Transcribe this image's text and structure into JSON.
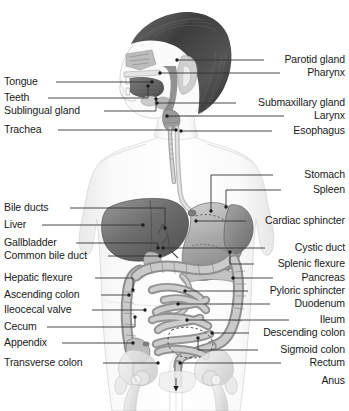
{
  "diagram": {
    "background_color": "#ffffff",
    "text_color": "#1a1a1a",
    "leader_line_color": "#333333",
    "labels_left": [
      {
        "text": "Tongue",
        "y": 82,
        "line_x1": 56,
        "line_y1": 82,
        "elbow_x": 152,
        "tip_x": 152,
        "tip_y": 82
      },
      {
        "text": "Teeth",
        "y": 98,
        "line_x1": 48,
        "line_y1": 98,
        "elbow_x": 148,
        "tip_x": 148,
        "tip_y": 86
      },
      {
        "text": "Sublingual gland",
        "y": 111,
        "line_x1": 104,
        "line_y1": 111,
        "elbow_x": 156,
        "tip_x": 156,
        "tip_y": 99
      },
      {
        "text": "Trachea",
        "y": 130,
        "line_x1": 58,
        "line_y1": 130,
        "elbow_x": 176,
        "tip_x": 176,
        "tip_y": 130
      },
      {
        "text": "Bile ducts",
        "y": 208,
        "line_x1": 70,
        "line_y1": 208,
        "elbow_x": 165,
        "tip_x": 165,
        "tip_y": 228
      },
      {
        "text": "Liver",
        "y": 225,
        "line_x1": 42,
        "line_y1": 225,
        "elbow_x": 143,
        "tip_x": 143,
        "tip_y": 225
      },
      {
        "text": "Gallbladder",
        "y": 243,
        "line_x1": 76,
        "line_y1": 243,
        "elbow_x": 158,
        "tip_x": 158,
        "tip_y": 248
      },
      {
        "text": "Common bile duct",
        "y": 256,
        "line_x1": 108,
        "line_y1": 256,
        "elbow_x": 160,
        "tip_x": 160,
        "tip_y": 256
      },
      {
        "text": "Hepatic flexure",
        "y": 278,
        "line_x1": 95,
        "line_y1": 278,
        "elbow_x": 133,
        "tip_x": 133,
        "tip_y": 290
      },
      {
        "text": "Ascending colon",
        "y": 295,
        "line_x1": 101,
        "line_y1": 295,
        "elbow_x": 129,
        "tip_x": 129,
        "tip_y": 295
      },
      {
        "text": "Ileocecal valve",
        "y": 310,
        "line_x1": 92,
        "line_y1": 310,
        "elbow_x": 145,
        "tip_x": 145,
        "tip_y": 310
      },
      {
        "text": "Cecum",
        "y": 327,
        "line_x1": 47,
        "line_y1": 327,
        "elbow_x": 135,
        "tip_x": 135,
        "tip_y": 317
      },
      {
        "text": "Appendix",
        "y": 343,
        "line_x1": 62,
        "line_y1": 343,
        "elbow_x": 133,
        "tip_x": 133,
        "tip_y": 343
      },
      {
        "text": "Transverse colon",
        "y": 363,
        "line_x1": 103,
        "line_y1": 363,
        "elbow_x": 158,
        "tip_x": 158,
        "tip_y": 363
      }
    ],
    "labels_right": [
      {
        "text": "Parotid gland",
        "y": 60,
        "line_x1": 264,
        "elbow_x": 177,
        "tip_x": 177,
        "tip_y": 60
      },
      {
        "text": "Pharynx",
        "y": 73,
        "line_x1": 280,
        "elbow_x": 160,
        "tip_x": 160,
        "tip_y": 73
      },
      {
        "text": "Submaxillary gland",
        "y": 103,
        "line_x1": 236,
        "elbow_x": 157,
        "tip_x": 157,
        "tip_y": 103
      },
      {
        "text": "Larynx",
        "y": 116,
        "line_x1": 284,
        "elbow_x": 167,
        "tip_x": 167,
        "tip_y": 116
      },
      {
        "text": "Esophagus",
        "y": 131,
        "line_x1": 272,
        "elbow_x": 181,
        "tip_x": 181,
        "tip_y": 131
      },
      {
        "text": "Stomach",
        "y": 175,
        "line_x1": 273,
        "elbow_x": 211,
        "tip_x": 211,
        "tip_y": 211
      },
      {
        "text": "Spleen",
        "y": 190,
        "line_x1": 281,
        "elbow_x": 226,
        "tip_x": 226,
        "tip_y": 207
      },
      {
        "text": "Cardiac sphincter",
        "y": 221,
        "line_x1": 246,
        "elbow_x": 196,
        "tip_x": 196,
        "tip_y": 221
      },
      {
        "text": "Cystic duct",
        "y": 248,
        "line_x1": 265,
        "elbow_x": 163,
        "tip_x": 163,
        "tip_y": 248
      },
      {
        "text": "Splenic flexure",
        "y": 264,
        "line_x1": 254,
        "elbow_x": 230,
        "tip_x": 230,
        "tip_y": 252
      },
      {
        "text": "Pancreas",
        "y": 278,
        "line_x1": 273,
        "elbow_x": 233,
        "tip_x": 233,
        "tip_y": 278
      },
      {
        "text": "Pyloric sphincter",
        "y": 291,
        "line_x1": 248,
        "elbow_x": 185,
        "tip_x": 185,
        "tip_y": 291
      },
      {
        "text": "Duodenum",
        "y": 304,
        "line_x1": 270,
        "elbow_x": 178,
        "tip_x": 178,
        "tip_y": 304
      },
      {
        "text": "Ileum",
        "y": 320,
        "line_x1": 289,
        "elbow_x": 187,
        "tip_x": 187,
        "tip_y": 320
      },
      {
        "text": "Descending colon",
        "y": 333,
        "line_x1": 249,
        "elbow_x": 212,
        "tip_x": 212,
        "tip_y": 333
      },
      {
        "text": "Sigmoid colon",
        "y": 350,
        "line_x1": 258,
        "elbow_x": 198,
        "tip_x": 198,
        "tip_y": 338
      },
      {
        "text": "Rectum",
        "y": 363,
        "line_x1": 281,
        "elbow_x": 180,
        "tip_x": 180,
        "tip_y": 363
      },
      {
        "text": "Anus",
        "y": 381,
        "line_x1": null,
        "elbow_x": null,
        "tip_x": 176,
        "tip_y": 390
      }
    ]
  }
}
